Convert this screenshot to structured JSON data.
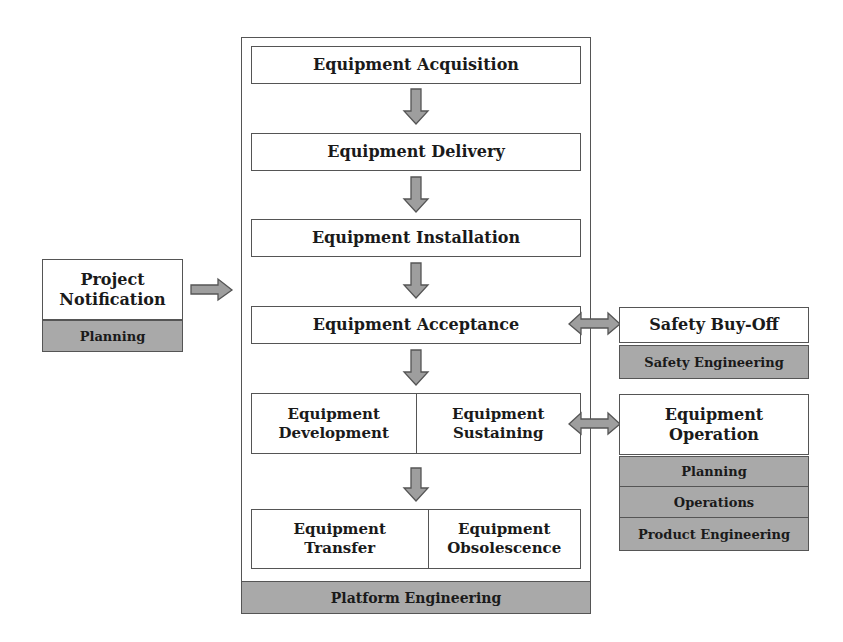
{
  "main_lifecycle": {
    "steps": [
      {
        "label": "Equipment Acquisition"
      },
      {
        "label": "Equipment Delivery"
      },
      {
        "label": "Equipment Installation"
      },
      {
        "label": "Equipment Acceptance"
      }
    ],
    "split_rows": [
      {
        "left": "Equipment Development",
        "right": "Equipment Sustaining"
      },
      {
        "left": "Equipment Transfer",
        "right": "Equipment Obsolescence"
      }
    ],
    "owner": "Platform Engineering"
  },
  "input": {
    "title": "Project Notification",
    "owner": "Planning"
  },
  "safety": {
    "title": "Safety Buy-Off",
    "owner": "Safety Engineering"
  },
  "operation": {
    "title": "Equipment Operation",
    "owners": [
      "Planning",
      "Operations",
      "Product Engineering"
    ]
  },
  "colors": {
    "box_fill": "#ffffff",
    "owner_fill": "#a9a9a9",
    "arrow_fill": "#9e9e9e",
    "border": "#555555"
  }
}
